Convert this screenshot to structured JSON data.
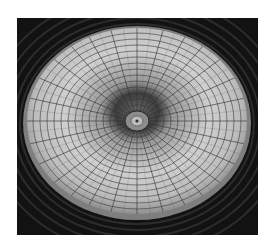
{
  "image": {
    "subject": "dome-ceiling",
    "description": "Grayscale photo of a glass dome ceiling viewed from below, with radial ribs and concentric rings converging on a central oculus",
    "colors": {
      "background": "#ffffff",
      "frame_dark": "#121212",
      "ring_dark": "#2a2a2a",
      "rim": "#8a8a8a",
      "glass_light": "#d8d8d8",
      "glass_mid": "#9a9a9a",
      "rib": "#3a3a3a"
    }
  }
}
